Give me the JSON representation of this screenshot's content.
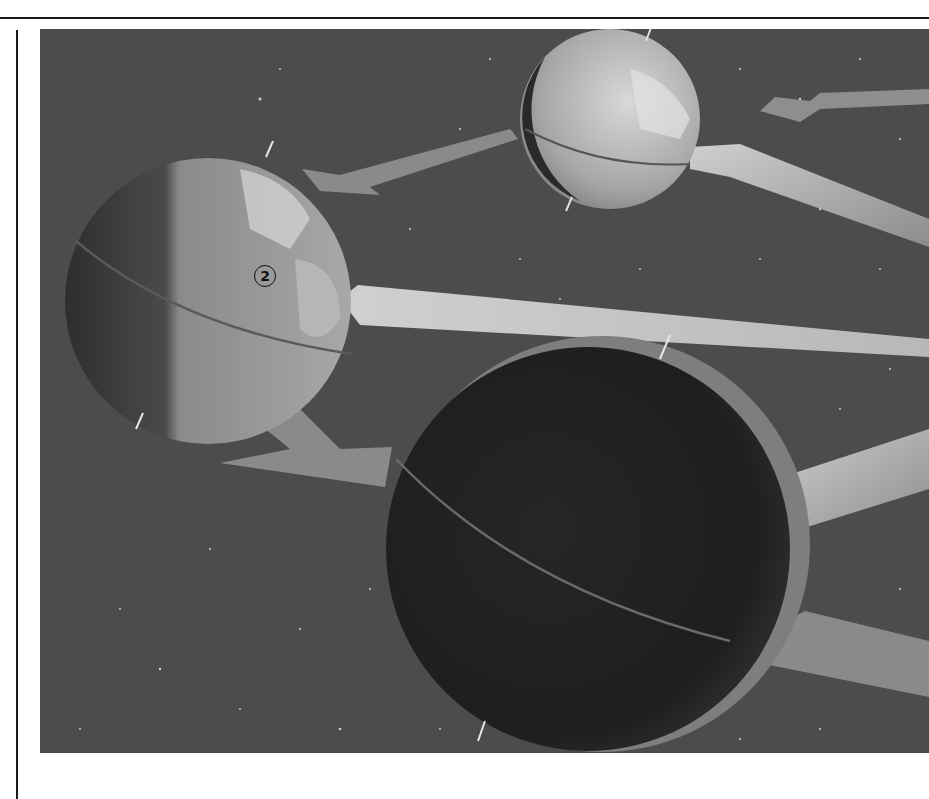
{
  "page": {
    "type": "scanned textbook figure",
    "background": "#ffffff",
    "rule_color": "#1a1a1a"
  },
  "figure": {
    "space_color": "#4c4c4c",
    "callouts": [
      {
        "id": "2",
        "label": "2"
      }
    ],
    "globes": [
      {
        "name": "small-globe-top",
        "lit": "mostly"
      },
      {
        "name": "medium-globe-left",
        "lit": "partial",
        "callout": "2"
      },
      {
        "name": "large-globe-bottom",
        "lit": "crescent"
      }
    ]
  }
}
